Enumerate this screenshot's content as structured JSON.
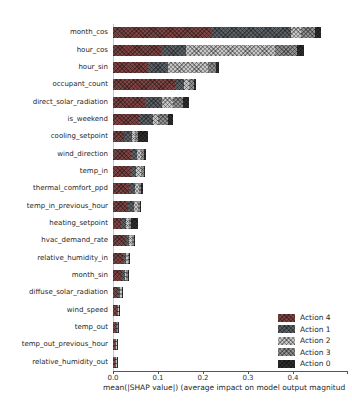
{
  "chart_data": {
    "type": "bar",
    "orientation": "horizontal",
    "stacked": true,
    "title": "",
    "xlabel": "mean(|SHAP value|) (average impact on model output magnitud",
    "ylabel": "",
    "xlim": [
      0,
      0.52
    ],
    "xticks": [
      "0.0",
      "0.1",
      "0.2",
      "0.3",
      "0.4"
    ],
    "xtick_values": [
      0.0,
      0.1,
      0.2,
      0.3,
      0.4
    ],
    "grid": false,
    "legend_position": "lower right",
    "categories": [
      "month_cos",
      "hour_cos",
      "hour_sin",
      "occupant_count",
      "direct_solar_radiation",
      "is_weekend",
      "cooling_setpoint",
      "wind_direction",
      "temp_in",
      "thermal_comfort_ppd",
      "temp_in_previous_hour",
      "heating_setpoint",
      "hvac_demand_rate",
      "relative_humidity_in",
      "month_sin",
      "diffuse_solar_radiation",
      "wind_speed",
      "temp_out",
      "temp_out_previous_hour",
      "relative_humidity_out"
    ],
    "series": [
      {
        "name": "Action 4",
        "color": "#7e4444",
        "values": [
          0.218,
          0.107,
          0.078,
          0.138,
          0.072,
          0.058,
          0.024,
          0.04,
          0.04,
          0.036,
          0.034,
          0.018,
          0.028,
          0.022,
          0.02,
          0.012,
          0.008,
          0.006,
          0.005,
          0.005
        ]
      },
      {
        "name": "Action 1",
        "color": "#5c6166",
        "values": [
          0.178,
          0.056,
          0.044,
          0.02,
          0.038,
          0.03,
          0.018,
          0.014,
          0.012,
          0.012,
          0.012,
          0.012,
          0.008,
          0.007,
          0.006,
          0.004,
          0.003,
          0.002,
          0.002,
          0.002
        ]
      },
      {
        "name": "Action 2",
        "color": "#c6c6c6",
        "values": [
          0.022,
          0.196,
          0.089,
          0.012,
          0.024,
          0.012,
          0.006,
          0.008,
          0.01,
          0.009,
          0.01,
          0.005,
          0.006,
          0.004,
          0.004,
          0.003,
          0.002,
          0.002,
          0.001,
          0.001
        ]
      },
      {
        "name": "Action 3",
        "color": "#909090",
        "values": [
          0.032,
          0.049,
          0.018,
          0.011,
          0.022,
          0.022,
          0.008,
          0.008,
          0.006,
          0.006,
          0.004,
          0.006,
          0.004,
          0.003,
          0.003,
          0.002,
          0.001,
          0.001,
          0.001,
          0.001
        ]
      },
      {
        "name": "Action 0",
        "color": "#2e2e2e",
        "values": [
          0.013,
          0.016,
          0.007,
          0.004,
          0.014,
          0.012,
          0.022,
          0.004,
          0.004,
          0.004,
          0.002,
          0.014,
          0.002,
          0.002,
          0.002,
          0.001,
          0.001,
          0.001,
          0.001,
          0.001
        ]
      }
    ],
    "legend_entries": [
      "Action 4",
      "Action 1",
      "Action 2",
      "Action 3",
      "Action 0"
    ]
  }
}
